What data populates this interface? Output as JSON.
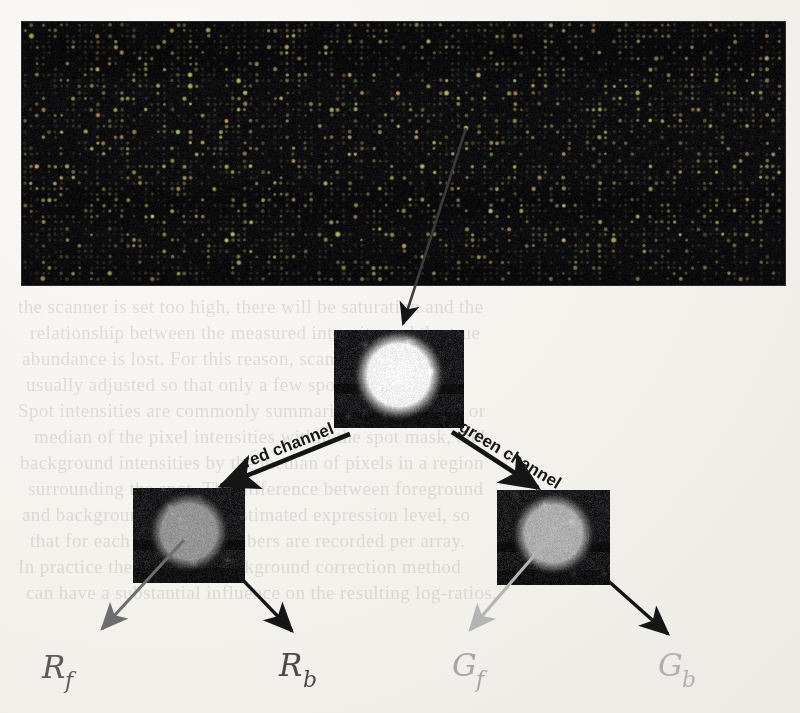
{
  "figure": {
    "kind": "microarray-spot-segmentation-diagram",
    "panels": {
      "array": {
        "name": "microarray-scan",
        "caption": ""
      },
      "composite": {
        "name": "composite-spot",
        "caption": ""
      },
      "red": {
        "name": "red-channel-spot",
        "caption": ""
      },
      "green": {
        "name": "green-channel-spot",
        "caption": ""
      }
    },
    "arrows": {
      "zoom": {
        "label": ""
      },
      "red_channel": {
        "label": "red channel"
      },
      "green_channel": {
        "label": "green channel"
      },
      "red_foreground": {
        "label": ""
      },
      "red_background": {
        "label": ""
      },
      "green_foreground": {
        "label": ""
      },
      "green_background": {
        "label": ""
      }
    },
    "symbols": {
      "red_foreground": {
        "base": "R",
        "sub": "f"
      },
      "red_background": {
        "base": "R",
        "sub": "b"
      },
      "green_foreground": {
        "base": "G",
        "sub": "f"
      },
      "green_background": {
        "base": "G",
        "sub": "b"
      }
    },
    "colors": {
      "paper": "#f3f2ee",
      "ink": "#121212",
      "arrow_dark": "#141414",
      "arrow_mid_gray": "#6d6d6d",
      "arrow_light_gray": "#b4b4b4",
      "symbol_dark": "#4a4a4a",
      "symbol_gray": "#8e8e8e",
      "symbol_light": "#bdbdbd",
      "array_background": "#07070a",
      "tile_background": "#09090c"
    }
  },
  "background_text": {
    "lines": [
      "the scanner is set too high, there will be saturation and the",
      "relationship between the measured intensity and the true",
      "abundance is lost. For this reason, scanner settings are",
      "usually adjusted so that only a few spots are saturated.",
      "Spot intensities are commonly summarised by the mean or",
      "median of the pixel intensities within the spot mask, and",
      "background intensities by the median of pixels in a region",
      "surrounding the spot. The difference between foreground",
      "and background gives the estimated expression level, so",
      "that for each spot four numbers are recorded per array.",
      "In practice the choice of background correction method",
      "can have a substantial influence on the resulting log-ratios,"
    ]
  }
}
